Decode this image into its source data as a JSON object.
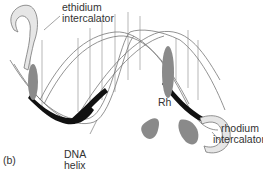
{
  "figure": {
    "panel_label": "(b)",
    "labels": {
      "ethidium_line1": "ethidium",
      "ethidium_line2": "intercalator",
      "rhodium_line1": "rhodium",
      "rhodium_line2": "intercalator",
      "rh": "Rh",
      "dna_line1": "DNA",
      "dna_line2": "helix"
    },
    "colors": {
      "strand_dark": "#111111",
      "groove_gray": "#8a8a8a",
      "light_ribbon": "#e6e6e6",
      "outline": "#777777"
    }
  }
}
